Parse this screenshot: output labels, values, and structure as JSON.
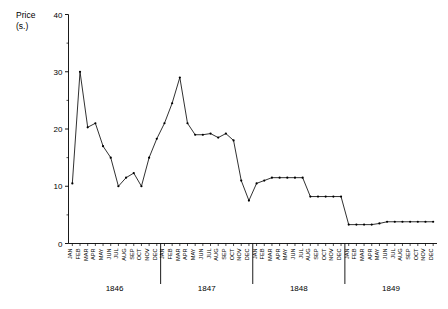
{
  "chart_data": {
    "type": "line",
    "title": "",
    "xlabel": "",
    "ylabel": "Price (s.)",
    "ylabel_line1": "Price",
    "ylabel_line2": "(s.)",
    "ylim": [
      0,
      40
    ],
    "ytick_labels": [
      "0",
      "10",
      "20",
      "30",
      "40"
    ],
    "ytick_values": [
      0,
      10,
      20,
      30,
      40
    ],
    "yminor_values": [
      5,
      15,
      25,
      35
    ],
    "grid": false,
    "legend": null,
    "months": [
      "JAN",
      "FEB",
      "MAR",
      "APR",
      "MAY",
      "JUN",
      "JUL",
      "AUG",
      "SEP",
      "OCT",
      "NOV",
      "DEC"
    ],
    "year_groups": [
      "1846",
      "1847",
      "1848",
      "1849"
    ],
    "categories": [
      "JAN 1846",
      "FEB 1846",
      "MAR 1846",
      "APR 1846",
      "MAY 1846",
      "JUN 1846",
      "JUL 1846",
      "AUG 1846",
      "SEP 1846",
      "OCT 1846",
      "NOV 1846",
      "DEC 1846",
      "JAN 1847",
      "FEB 1847",
      "MAR 1847",
      "APR 1847",
      "MAY 1847",
      "JUN 1847",
      "JUL 1847",
      "AUG 1847",
      "SEP 1847",
      "OCT 1847",
      "NOV 1847",
      "DEC 1847",
      "JAN 1848",
      "FEB 1848",
      "MAR 1848",
      "APR 1848",
      "MAY 1848",
      "JUN 1848",
      "JUL 1848",
      "AUG 1848",
      "SEP 1848",
      "OCT 1848",
      "NOV 1848",
      "DEC 1848",
      "JAN 1849",
      "FEB 1849",
      "MAR 1849",
      "APR 1849",
      "MAY 1849",
      "JUN 1849",
      "JUL 1849",
      "AUG 1849",
      "SEP 1849",
      "OCT 1849",
      "NOV 1849",
      "DEC 1849"
    ],
    "values": [
      10.5,
      30.0,
      20.3,
      21.0,
      17.0,
      15.0,
      10.0,
      11.5,
      12.3,
      10.0,
      15.0,
      18.3,
      21.0,
      24.5,
      29.0,
      21.0,
      19.0,
      19.0,
      19.2,
      18.5,
      19.2,
      18.0,
      11.0,
      7.5,
      10.5,
      11.0,
      11.5,
      11.5,
      11.5,
      11.5,
      11.5,
      8.2,
      8.2,
      8.2,
      8.2,
      8.2,
      3.3,
      3.3,
      3.3,
      3.3,
      3.5,
      3.8,
      3.8,
      3.8,
      3.8,
      3.8,
      3.8,
      3.8
    ],
    "marker": "dot",
    "line_color": "#1a1a1a"
  }
}
